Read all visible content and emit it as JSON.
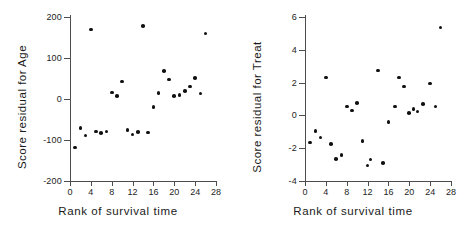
{
  "figure": {
    "width": 471,
    "height": 235,
    "background": "#ffffff",
    "point_color": "#111111",
    "axis_color": "#4d4d4d"
  },
  "chart_data": [
    {
      "type": "scatter",
      "title": "",
      "panel": "left",
      "xlabel": "Rank of survival time",
      "ylabel": "Score residual for Age",
      "xlim": [
        0,
        28
      ],
      "ylim": [
        -200,
        200
      ],
      "xticks": [
        0,
        4,
        8,
        12,
        16,
        20,
        24,
        28
      ],
      "yticks": [
        200,
        100,
        0,
        -100,
        -200
      ],
      "ytick_labels": [
        "200",
        "100",
        "0",
        "-100",
        "-200"
      ],
      "grid": false,
      "legend": "none",
      "x": [
        1,
        2,
        3,
        4,
        5,
        6,
        7,
        8,
        9,
        10,
        11,
        12,
        13,
        14,
        15,
        16,
        17,
        18,
        19,
        20,
        21,
        22,
        23,
        24,
        25,
        26
      ],
      "y": [
        -118,
        -71,
        -89,
        170,
        -79,
        -83,
        -79,
        16,
        8,
        43,
        -76,
        -87,
        -81,
        178,
        -82,
        -20,
        14,
        68,
        48,
        7,
        10,
        20,
        30,
        51,
        13,
        160
      ]
    },
    {
      "type": "scatter",
      "title": "",
      "panel": "right",
      "xlabel": "Rank of survival time",
      "ylabel": "Score residual for Treat",
      "xlim": [
        0,
        28
      ],
      "ylim": [
        -4,
        6
      ],
      "xticks": [
        0,
        4,
        8,
        12,
        16,
        20,
        24,
        28
      ],
      "yticks": [
        6,
        4,
        2,
        0,
        -2,
        -4
      ],
      "ytick_labels": [
        "6",
        "4",
        "2",
        "0",
        "-2",
        "-4"
      ],
      "grid": false,
      "legend": "none",
      "x": [
        1,
        2,
        3,
        4,
        5,
        6,
        7,
        8,
        9,
        10,
        11,
        12,
        12.6,
        14,
        15,
        16,
        17.3,
        18,
        19,
        20,
        20.8,
        21.6,
        22.6,
        24,
        25,
        26
      ],
      "y": [
        -1.65,
        -0.95,
        -1.35,
        2.3,
        -1.75,
        -2.65,
        -2.4,
        0.55,
        0.3,
        0.75,
        -1.55,
        -3.05,
        -2.7,
        2.75,
        -2.9,
        -0.4,
        0.55,
        2.3,
        1.75,
        0.15,
        0.4,
        0.25,
        0.7,
        1.95,
        0.55,
        5.35
      ]
    }
  ]
}
